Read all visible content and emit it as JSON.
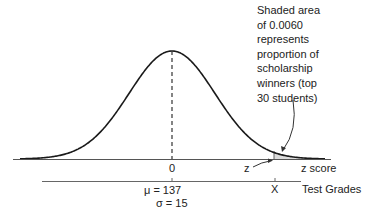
{
  "diagram": {
    "type": "normal-distribution",
    "annotation": {
      "lines": [
        "Shaded area",
        "of 0.0060",
        "represents",
        "proportion of",
        "scholarship",
        "winners (top",
        "30 students)"
      ]
    },
    "upper_axis": {
      "center_label": "0",
      "cutoff_label": "z",
      "axis_label": "z score"
    },
    "lower_axis": {
      "cutoff_label": "X",
      "axis_label": "Test Grades",
      "mean_label": "μ = 137",
      "sd_label": "σ = 15"
    },
    "shaded_area": 0.006,
    "colors": {
      "line": "#1a1a1a",
      "shade": "#dcdcdc",
      "axis": "#555555"
    }
  }
}
